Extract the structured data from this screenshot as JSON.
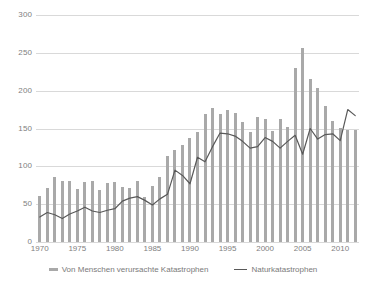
{
  "chart_data": {
    "type": "bar",
    "title": "",
    "subtitle": "",
    "xlabel": "",
    "ylabel": "",
    "ylim": [
      0,
      300
    ],
    "ytick_values": [
      0,
      50,
      100,
      150,
      200,
      250,
      300
    ],
    "ytick_labels": [
      "0",
      "50",
      "100",
      "150",
      "200",
      "250",
      "300"
    ],
    "xtick_labels": [
      "1970",
      "1975",
      "1980",
      "1985",
      "1990",
      "1995",
      "2000",
      "2005",
      "2010"
    ],
    "grid": true,
    "legend_position": "bottom",
    "categories": [
      1970,
      1971,
      1972,
      1973,
      1974,
      1975,
      1976,
      1977,
      1978,
      1979,
      1980,
      1981,
      1982,
      1983,
      1984,
      1985,
      1986,
      1987,
      1988,
      1989,
      1990,
      1991,
      1992,
      1993,
      1994,
      1995,
      1996,
      1997,
      1998,
      1999,
      2000,
      2001,
      2002,
      2003,
      2004,
      2005,
      2006,
      2007,
      2008,
      2009,
      2010,
      2011,
      2012
    ],
    "series": [
      {
        "name": "Von Menschen verursachte Katastrophen",
        "kind": "bar",
        "color": "#a9a9a9",
        "values": [
          61,
          72,
          86,
          81,
          80,
          70,
          79,
          81,
          69,
          78,
          79,
          73,
          72,
          81,
          59,
          74,
          86,
          114,
          122,
          128,
          138,
          145,
          169,
          177,
          169,
          174,
          170,
          159,
          146,
          165,
          162,
          147,
          162,
          152,
          230,
          256,
          216,
          204,
          180,
          160,
          151,
          148,
          148
        ]
      },
      {
        "name": "Naturkatastrophen",
        "kind": "line",
        "color": "#595959",
        "values": [
          33,
          39,
          36,
          31,
          37,
          41,
          46,
          41,
          39,
          42,
          44,
          54,
          58,
          60,
          55,
          49,
          57,
          63,
          95,
          88,
          77,
          112,
          106,
          126,
          144,
          143,
          140,
          133,
          124,
          126,
          138,
          133,
          124,
          133,
          141,
          116,
          150,
          136,
          142,
          143,
          134,
          175,
          167
        ]
      }
    ]
  },
  "legend": {
    "bars_label": "Von Menschen verursachte Katastrophen",
    "line_label": "Naturkatastrophen"
  }
}
